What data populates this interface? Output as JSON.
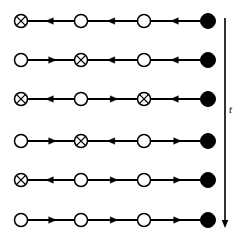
{
  "figure": {
    "type": "diagram",
    "background_color": "#ffffff",
    "stroke_color": "#000000",
    "axis": {
      "label": "t",
      "name": "time-axis",
      "direction": "downward",
      "x": 225,
      "y_start": 18,
      "y_end": 228,
      "label_x": 229,
      "label_y": 110
    },
    "node_positions_x": [
      21,
      81,
      144,
      208
    ],
    "row_positions_y": [
      21,
      60,
      99,
      141,
      180,
      220
    ],
    "node_radius": {
      "open": 6.5,
      "crossed": 6.5,
      "filled": 7.5
    },
    "node_legend": {
      "open": "open-circle",
      "crossed": "crossed-circle",
      "filled": "filled-circle"
    },
    "arrow_legend": {
      "left": "arrow-left",
      "right": "arrow-right"
    },
    "rows": [
      {
        "index": 1,
        "nodes": [
          "crossed",
          "open",
          "open",
          "filled"
        ],
        "arrows": [
          "left",
          "left",
          "left"
        ]
      },
      {
        "index": 2,
        "nodes": [
          "open",
          "crossed",
          "open",
          "filled"
        ],
        "arrows": [
          "right",
          "left",
          "left"
        ]
      },
      {
        "index": 3,
        "nodes": [
          "crossed",
          "open",
          "crossed",
          "filled"
        ],
        "arrows": [
          "left",
          "right",
          "left"
        ]
      },
      {
        "index": 4,
        "nodes": [
          "open",
          "crossed",
          "open",
          "filled"
        ],
        "arrows": [
          "right",
          "left",
          "right"
        ]
      },
      {
        "index": 5,
        "nodes": [
          "crossed",
          "open",
          "open",
          "filled"
        ],
        "arrows": [
          "left",
          "right",
          "right"
        ]
      },
      {
        "index": 6,
        "nodes": [
          "open",
          "open",
          "open",
          "filled"
        ],
        "arrows": [
          "right",
          "right",
          "right"
        ]
      }
    ]
  }
}
